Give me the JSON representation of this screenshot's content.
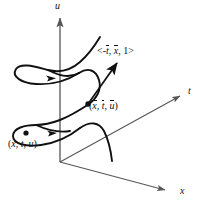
{
  "figure": {
    "name": "helix-curve-with-tangent-vector-3d-axes",
    "background_color": "#ffffff",
    "stroke_color": "#111111",
    "axis_color": "#555555"
  },
  "axes": {
    "u": {
      "label": "u",
      "icon": "axis-arrow-up",
      "x": 60,
      "y": 162,
      "tip_x": 60,
      "tip_y": 13
    },
    "t": {
      "label": "t",
      "icon": "axis-arrow-upright",
      "x": 60,
      "y": 162,
      "tip_x": 185,
      "tip_y": 93
    },
    "x": {
      "label": "x",
      "icon": "axis-arrow-downright",
      "x": 60,
      "y": 162,
      "tip_x": 170,
      "tip_y": 193
    },
    "origin": {
      "x": 60,
      "y": 162
    }
  },
  "labels": {
    "vector": {
      "full": "<-t, x, 1>",
      "open": "<",
      "minus": "-",
      "comp1": "t",
      "sep1": ", ",
      "comp2": "x",
      "sep2": ", ",
      "comp3": "1",
      "close": ">"
    },
    "point_bar": {
      "full": "(x, t, u)",
      "open": "(",
      "comp1": "x",
      "sep1": ", ",
      "comp2": "t",
      "sep2": ", ",
      "comp3": "u",
      "close": ")"
    },
    "point_plain": {
      "full": "(x, t, u)",
      "open": "(",
      "comp1": "x",
      "sep1": ", ",
      "comp2": "t",
      "sep2": ", ",
      "comp3": "u",
      "close": ")"
    }
  },
  "markers": {
    "point_on_curve_upper": {
      "x": 88,
      "y": 104,
      "r": 2.6
    },
    "point_on_curve_lower": {
      "x": 26,
      "y": 133,
      "r": 2.6
    }
  },
  "tangent_vector": {
    "from_x": 88,
    "from_y": 104,
    "to_x": 119,
    "to_y": 60
  }
}
